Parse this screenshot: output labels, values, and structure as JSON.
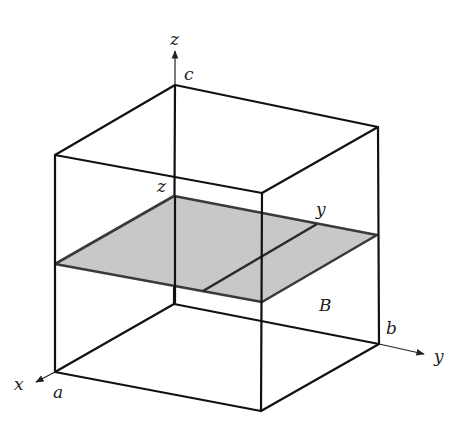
{
  "figure": {
    "type": "3d-box-with-cross-section",
    "colors": {
      "edge": "#111111",
      "plane_fill": "#c8c8c8",
      "plane_stroke": "#3a3a3a"
    },
    "axes": {
      "z": {
        "label": "z",
        "extent_label": "c"
      },
      "y": {
        "label": "y",
        "extent_label": "b"
      },
      "x": {
        "label": "x",
        "extent_label": "a"
      }
    },
    "section": {
      "z_label": "z",
      "y_label": "y",
      "region_label": "B"
    }
  }
}
